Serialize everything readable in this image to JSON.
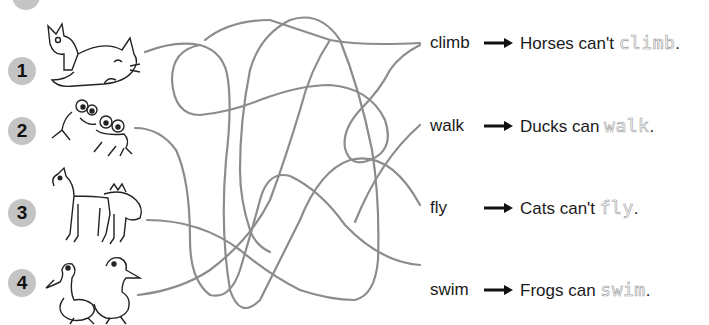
{
  "exercise": {
    "items": [
      {
        "number": "1",
        "animal": "cats"
      },
      {
        "number": "2",
        "animal": "frogs"
      },
      {
        "number": "3",
        "animal": "horses"
      },
      {
        "number": "4",
        "animal": "ducks"
      }
    ],
    "answers": [
      {
        "word": "climb",
        "sentence_prefix": "Horses can't ",
        "traced": "climb",
        "end": "."
      },
      {
        "word": "walk",
        "sentence_prefix": "Ducks can ",
        "traced": "walk",
        "end": "."
      },
      {
        "word": "fly",
        "sentence_prefix": "Cats can't ",
        "traced": "fly",
        "end": "."
      },
      {
        "word": "swim",
        "sentence_prefix": "Frogs can ",
        "traced": "swim",
        "end": "."
      }
    ],
    "colors": {
      "maze_line": "#8c8c8c",
      "number_bubble": "#c4c4c4",
      "traced_text": "#9a9a9a",
      "text": "#1a1a1a"
    }
  }
}
